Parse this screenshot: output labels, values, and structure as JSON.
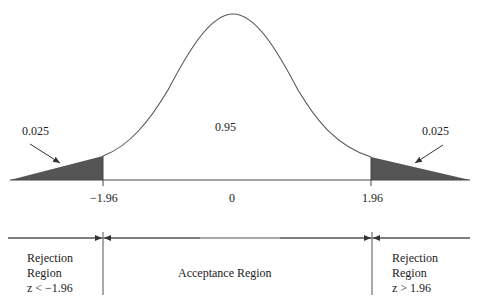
{
  "diagram": {
    "type": "normal-distribution-two-tailed-test",
    "center_area": "0.95",
    "left_tail_area": "0.025",
    "right_tail_area": "0.025",
    "ticks": [
      "−1.96",
      "0",
      "1.96"
    ],
    "regions": {
      "left": {
        "line1": "Rejection",
        "line2": "Region",
        "line3": "z < −1.96"
      },
      "middle": {
        "label": "Acceptance Region"
      },
      "right": {
        "line1": "Rejection",
        "line2": "Region",
        "line3": "z > 1.96"
      }
    },
    "colors": {
      "curve": "#555555",
      "shade": "#555555",
      "axis": "#444444"
    }
  }
}
